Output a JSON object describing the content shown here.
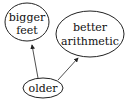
{
  "diagram": {
    "type": "causal-graph",
    "nodes": [
      {
        "id": "bigger_feet",
        "lines": [
          "bigger",
          "feet"
        ]
      },
      {
        "id": "better_arithmetic",
        "lines": [
          "better",
          "arithmetic"
        ]
      },
      {
        "id": "older",
        "lines": [
          "older"
        ]
      }
    ],
    "edges": [
      {
        "from": "older",
        "to": "bigger_feet"
      },
      {
        "from": "older",
        "to": "better_arithmetic"
      }
    ],
    "colors": {
      "stroke": "#222222",
      "text": "#111111",
      "background": "#ffffff"
    }
  }
}
